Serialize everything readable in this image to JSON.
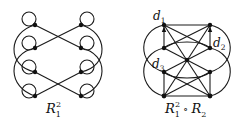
{
  "diagrams": [
    {
      "id": "left",
      "caption": {
        "base": "R",
        "sub": "1",
        "sup": "2"
      },
      "description": "Relation R1 squared: 8 vertices in two columns, each with a self-loop, crossing edges and outer arcs"
    },
    {
      "id": "right",
      "caption": {
        "base": "R",
        "sub": "1",
        "sup": "2",
        "op": "∘",
        "base2": "R",
        "sub2": "2"
      },
      "vertex_labels": [
        "d1",
        "d2",
        "d3"
      ],
      "vertex_labels_parts": [
        {
          "base": "d",
          "sub": "1"
        },
        {
          "base": "d",
          "sub": "2"
        },
        {
          "base": "d",
          "sub": "3"
        }
      ],
      "description": "Composition R1^2 ∘ R2: vertices with arrows, diagonals through centre, and outer arcs"
    }
  ],
  "colors": {
    "stroke": "#1a1a1a",
    "background": "#ffffff"
  }
}
